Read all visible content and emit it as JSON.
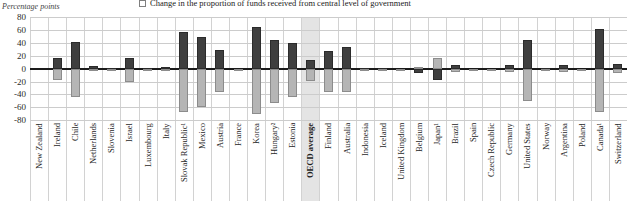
{
  "page": {
    "units_label": "Percentage points"
  },
  "legend": {
    "label": "Change in the proportion of funds received from central level of government",
    "swatch_color": "#b5b5b5"
  },
  "chart_data": {
    "type": "bar",
    "title": "Change in the proportion of funds received from central level of government",
    "ylabel": "Percentage points",
    "xlabel": "",
    "ylim": [
      -80,
      80
    ],
    "yticks": [
      80,
      60,
      40,
      20,
      0,
      -20,
      -40,
      -60,
      -80
    ],
    "grid": true,
    "legend_position": "top",
    "highlight_category": "OECD average",
    "categories": [
      "New Zealand",
      "Ireland",
      "Chile",
      "Netherlands",
      "Slovenia",
      "Israel",
      "Luxembourg",
      "Italy",
      "Slovak Republic¹",
      "Mexico",
      "Austria",
      "France",
      "Korea",
      "Hungary²",
      "Estonia",
      "OECD average",
      "Finland",
      "Australia",
      "Indonesia",
      "Iceland",
      "United Kingdom",
      "Belgium",
      "Japan¹",
      "Brazil",
      "Spain",
      "Czech Republic",
      "Germany",
      "United States",
      "Norway",
      "Argentina",
      "Poland",
      "Canada¹",
      "Switzerland"
    ],
    "series": [
      {
        "name": "",
        "id": "dark-series",
        "color": "#3f3f3f",
        "values": [
          0,
          16,
          41,
          4,
          1,
          17,
          1,
          3,
          56,
          49,
          29,
          0,
          65,
          45,
          40,
          14,
          28,
          34,
          1,
          1,
          0,
          -7,
          -17,
          5,
          0,
          0,
          5,
          44,
          1,
          6,
          0,
          61,
          7
        ]
      },
      {
        "name": "Change in the proportion of funds received from central level of government",
        "id": "light-series",
        "color": "#b5b5b5",
        "values": [
          0,
          -18,
          -44,
          -4,
          -3,
          -21,
          -1,
          -2,
          -67,
          -59,
          -36,
          -2,
          -70,
          -53,
          -44,
          -19,
          -36,
          -36,
          -1,
          -2,
          -1,
          2,
          17,
          -6,
          -1,
          -2,
          -6,
          -50,
          -2,
          -6,
          -2,
          -67,
          -7
        ]
      }
    ]
  }
}
